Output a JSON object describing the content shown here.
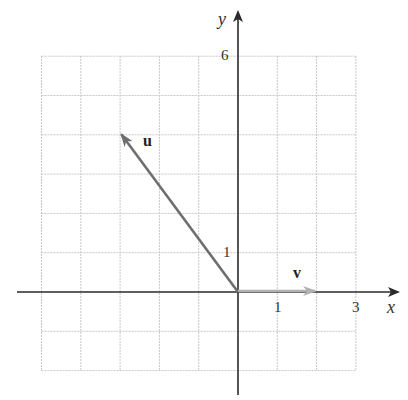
{
  "diagram": {
    "axes": {
      "x_label": "x",
      "y_label": "y",
      "x_ticks": [
        {
          "value": 1,
          "label": "1"
        },
        {
          "value": 3,
          "label": "3"
        }
      ],
      "y_ticks": [
        {
          "value": 1,
          "label": "1"
        },
        {
          "value": 6,
          "label": "6"
        }
      ]
    },
    "grid": {
      "x_range": [
        -5,
        3
      ],
      "y_range": [
        -2,
        6
      ],
      "spacing": 1
    },
    "vectors": [
      {
        "name": "u",
        "label": "u",
        "start": [
          0,
          0
        ],
        "end": [
          -3,
          4
        ],
        "color": "#6e6e6e"
      },
      {
        "name": "v",
        "label": "v",
        "start": [
          0,
          0
        ],
        "end": [
          2,
          0
        ],
        "color": "#b0b0b0"
      }
    ],
    "colors": {
      "grid": "#c8c8c8",
      "axis": "#2a2a2a"
    }
  }
}
